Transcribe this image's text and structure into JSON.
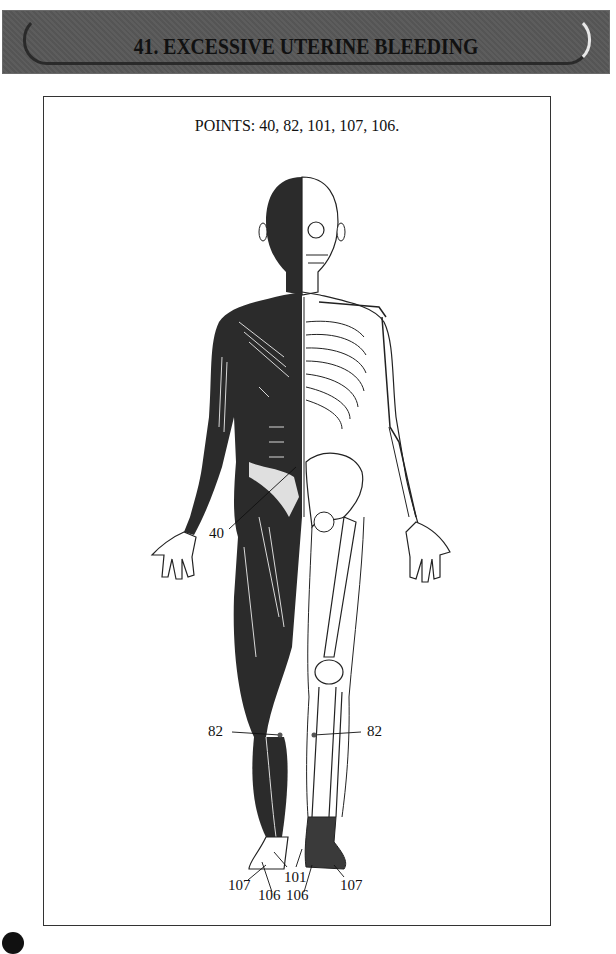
{
  "header": {
    "title": "41. EXCESSIVE UTERINE BLEEDING",
    "chapter_number": "41",
    "condition": "EXCESSIVE UTERINE BLEEDING"
  },
  "figure": {
    "points_caption": "POINTS: 40, 82, 101, 107, 106.",
    "points": [
      "40",
      "82",
      "101",
      "107",
      "106"
    ],
    "labels": [
      {
        "id": "40",
        "text": "40",
        "location": "lower abdomen / groin"
      },
      {
        "id": "82-left",
        "text": "82",
        "location": "left lower leg"
      },
      {
        "id": "82-right",
        "text": "82",
        "location": "right lower leg"
      },
      {
        "id": "107-left",
        "text": "107",
        "location": "left foot"
      },
      {
        "id": "106-left",
        "text": "106",
        "location": "left foot"
      },
      {
        "id": "101",
        "text": "101",
        "location": "between feet"
      },
      {
        "id": "106-right",
        "text": "106",
        "location": "right foot"
      },
      {
        "id": "107-right",
        "text": "107",
        "location": "right foot"
      }
    ]
  },
  "colors": {
    "banner_gray": "#979797",
    "ink": "#111111",
    "muscle_dark": "#2b2b2b"
  }
}
